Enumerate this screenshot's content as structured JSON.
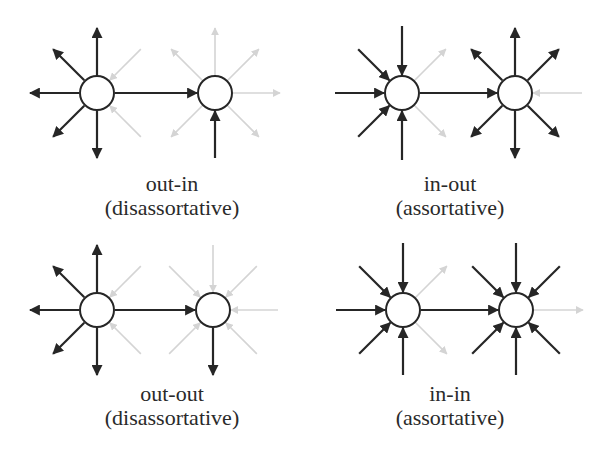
{
  "colors": {
    "edge": "#262626",
    "ghost_edge": "#d4d4d4",
    "node_stroke": "#262626",
    "node_fill": "#ffffff",
    "text": "#2a2a2a"
  },
  "panels": [
    {
      "id": "out-in",
      "title": "out-in",
      "subtitle": "(disassortative)",
      "label_pos": [
        172,
        172
      ],
      "nodes": [
        {
          "x": 97,
          "y": 93,
          "r": 17
        },
        {
          "x": 215,
          "y": 93,
          "r": 17
        }
      ],
      "edges": [
        {
          "node": 0,
          "dir": "out",
          "angle": 270,
          "len": 48
        },
        {
          "node": 0,
          "dir": "out",
          "angle": 225,
          "len": 45
        },
        {
          "node": 0,
          "dir": "out",
          "angle": 180,
          "len": 50
        },
        {
          "node": 0,
          "dir": "out",
          "angle": 135,
          "len": 45
        },
        {
          "node": 0,
          "dir": "out",
          "angle": 90,
          "len": 48
        },
        {
          "node": 1,
          "dir": "in",
          "angle": 90,
          "len": 48
        }
      ],
      "link": {
        "from": 0,
        "to": 1
      },
      "ghost_edges": [
        {
          "node": 1,
          "dir": "out",
          "angle": 270,
          "len": 48
        },
        {
          "node": 1,
          "dir": "out",
          "angle": 315,
          "len": 45
        },
        {
          "node": 1,
          "dir": "out",
          "angle": 225,
          "len": 45
        },
        {
          "node": 1,
          "dir": "out",
          "angle": 0,
          "len": 48
        },
        {
          "node": 1,
          "dir": "out",
          "angle": 45,
          "len": 45
        },
        {
          "node": 1,
          "dir": "out",
          "angle": 135,
          "len": 45
        },
        {
          "node": 0,
          "dir": "in",
          "angle": 315,
          "len": 45
        },
        {
          "node": 0,
          "dir": "in",
          "angle": 45,
          "len": 45
        }
      ]
    },
    {
      "id": "in-out",
      "title": "in-out",
      "subtitle": "(assortative)",
      "label_pos": [
        450,
        172
      ],
      "nodes": [
        {
          "x": 402,
          "y": 93,
          "r": 17
        },
        {
          "x": 515,
          "y": 93,
          "r": 17
        }
      ],
      "edges": [
        {
          "node": 0,
          "dir": "in",
          "angle": 270,
          "len": 50
        },
        {
          "node": 0,
          "dir": "in",
          "angle": 225,
          "len": 45
        },
        {
          "node": 0,
          "dir": "in",
          "angle": 180,
          "len": 50
        },
        {
          "node": 0,
          "dir": "in",
          "angle": 135,
          "len": 45
        },
        {
          "node": 0,
          "dir": "in",
          "angle": 90,
          "len": 50
        },
        {
          "node": 1,
          "dir": "out",
          "angle": 270,
          "len": 48
        },
        {
          "node": 1,
          "dir": "out",
          "angle": 225,
          "len": 45
        },
        {
          "node": 1,
          "dir": "out",
          "angle": 315,
          "len": 45
        },
        {
          "node": 1,
          "dir": "out",
          "angle": 135,
          "len": 45
        },
        {
          "node": 1,
          "dir": "out",
          "angle": 45,
          "len": 45
        },
        {
          "node": 1,
          "dir": "out",
          "angle": 90,
          "len": 48
        }
      ],
      "link": {
        "from": 0,
        "to": 1
      },
      "ghost_edges": [
        {
          "node": 0,
          "dir": "out",
          "angle": 315,
          "len": 45
        },
        {
          "node": 0,
          "dir": "out",
          "angle": 45,
          "len": 45
        },
        {
          "node": 1,
          "dir": "in",
          "angle": 0,
          "len": 50
        }
      ]
    },
    {
      "id": "out-out",
      "title": "out-out",
      "subtitle": "(disassortative)",
      "label_pos": [
        172,
        382
      ],
      "nodes": [
        {
          "x": 97,
          "y": 310,
          "r": 17
        },
        {
          "x": 213,
          "y": 310,
          "r": 17
        }
      ],
      "edges": [
        {
          "node": 0,
          "dir": "out",
          "angle": 270,
          "len": 48
        },
        {
          "node": 0,
          "dir": "out",
          "angle": 225,
          "len": 45
        },
        {
          "node": 0,
          "dir": "out",
          "angle": 180,
          "len": 50
        },
        {
          "node": 0,
          "dir": "out",
          "angle": 135,
          "len": 45
        },
        {
          "node": 0,
          "dir": "out",
          "angle": 90,
          "len": 48
        },
        {
          "node": 1,
          "dir": "out",
          "angle": 90,
          "len": 48
        }
      ],
      "link": {
        "from": 0,
        "to": 1
      },
      "ghost_edges": [
        {
          "node": 1,
          "dir": "in",
          "angle": 270,
          "len": 48
        },
        {
          "node": 1,
          "dir": "in",
          "angle": 315,
          "len": 45
        },
        {
          "node": 1,
          "dir": "in",
          "angle": 225,
          "len": 45
        },
        {
          "node": 1,
          "dir": "in",
          "angle": 0,
          "len": 48
        },
        {
          "node": 1,
          "dir": "in",
          "angle": 45,
          "len": 45
        },
        {
          "node": 1,
          "dir": "in",
          "angle": 135,
          "len": 45
        },
        {
          "node": 0,
          "dir": "in",
          "angle": 315,
          "len": 45
        },
        {
          "node": 0,
          "dir": "in",
          "angle": 45,
          "len": 45
        }
      ]
    },
    {
      "id": "in-in",
      "title": "in-in",
      "subtitle": "(assortative)",
      "label_pos": [
        450,
        382
      ],
      "nodes": [
        {
          "x": 403,
          "y": 310,
          "r": 17
        },
        {
          "x": 516,
          "y": 310,
          "r": 17
        }
      ],
      "edges": [
        {
          "node": 0,
          "dir": "in",
          "angle": 270,
          "len": 50
        },
        {
          "node": 0,
          "dir": "in",
          "angle": 225,
          "len": 45
        },
        {
          "node": 0,
          "dir": "in",
          "angle": 180,
          "len": 50
        },
        {
          "node": 0,
          "dir": "in",
          "angle": 135,
          "len": 45
        },
        {
          "node": 0,
          "dir": "in",
          "angle": 90,
          "len": 48
        },
        {
          "node": 1,
          "dir": "in",
          "angle": 270,
          "len": 50
        },
        {
          "node": 1,
          "dir": "in",
          "angle": 225,
          "len": 45
        },
        {
          "node": 1,
          "dir": "in",
          "angle": 315,
          "len": 45
        },
        {
          "node": 1,
          "dir": "in",
          "angle": 135,
          "len": 45
        },
        {
          "node": 1,
          "dir": "in",
          "angle": 45,
          "len": 45
        },
        {
          "node": 1,
          "dir": "in",
          "angle": 90,
          "len": 48
        }
      ],
      "link": {
        "from": 0,
        "to": 1
      },
      "ghost_edges": [
        {
          "node": 0,
          "dir": "out",
          "angle": 315,
          "len": 45
        },
        {
          "node": 0,
          "dir": "out",
          "angle": 45,
          "len": 45
        },
        {
          "node": 1,
          "dir": "out",
          "angle": 0,
          "len": 50
        }
      ]
    }
  ]
}
